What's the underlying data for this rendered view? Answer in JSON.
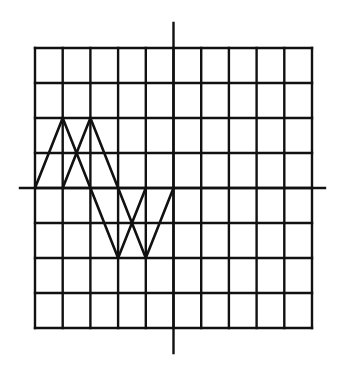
{
  "diagram": {
    "type": "grid-waveform",
    "colors": {
      "background": "#ffffff",
      "ink": "#111111"
    },
    "grid": {
      "columns": 10,
      "rows": 8,
      "left": 35,
      "top": 48,
      "right": 312,
      "bottom": 328
    },
    "axes": {
      "horizontal": {
        "row": 4,
        "x_start": 20,
        "x_end": 325
      },
      "vertical": {
        "col": 5,
        "y_start": 23,
        "y_end": 353
      }
    },
    "waves": [
      {
        "name": "wave-1",
        "points": [
          [
            0,
            4
          ],
          [
            1,
            2
          ],
          [
            2,
            4
          ],
          [
            3,
            6
          ],
          [
            4,
            4
          ]
        ]
      },
      {
        "name": "wave-2",
        "points": [
          [
            1,
            4
          ],
          [
            2,
            2
          ],
          [
            3,
            4
          ],
          [
            4,
            6
          ],
          [
            5,
            4
          ]
        ]
      }
    ]
  }
}
